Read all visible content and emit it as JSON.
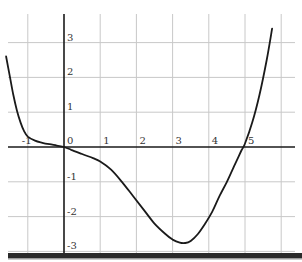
{
  "chart_data": {
    "type": "line",
    "title": "",
    "xlabel": "",
    "ylabel": "",
    "xlim": [
      -1.6,
      6.4
    ],
    "ylim": [
      -3.1,
      3.7
    ],
    "grid": true,
    "x_ticks": [
      -1,
      0,
      1,
      2,
      3,
      4,
      5
    ],
    "x_tick_labels": [
      "-1",
      "0",
      "1",
      "2",
      "3",
      "4",
      "5"
    ],
    "y_ticks": [
      3,
      2,
      1,
      -1,
      -2,
      -3
    ],
    "y_tick_labels": [
      "3",
      "2",
      "1",
      "-1",
      "-2",
      "-3"
    ],
    "series": [
      {
        "name": "f(x)",
        "color": "#1a1a1a",
        "x": [
          -1.6,
          -1.5,
          -1.4,
          -1.3,
          -1.2,
          -1.1,
          -1.0,
          -0.8,
          -0.6,
          -0.4,
          -0.2,
          0.0,
          0.2,
          0.5,
          0.8,
          1.0,
          1.3,
          1.6,
          1.9,
          2.2,
          2.5,
          2.8,
          3.0,
          3.2,
          3.35,
          3.5,
          3.7,
          3.9,
          4.1,
          4.3,
          4.5,
          4.7,
          4.9,
          5.0,
          5.2,
          5.4,
          5.6,
          5.75
        ],
        "y": [
          2.6,
          2.05,
          1.5,
          1.05,
          0.7,
          0.45,
          0.3,
          0.18,
          0.12,
          0.08,
          0.04,
          0.0,
          -0.08,
          -0.2,
          -0.32,
          -0.42,
          -0.65,
          -1.0,
          -1.4,
          -1.8,
          -2.2,
          -2.5,
          -2.66,
          -2.75,
          -2.76,
          -2.7,
          -2.5,
          -2.2,
          -1.85,
          -1.4,
          -1.0,
          -0.55,
          -0.1,
          0.1,
          0.7,
          1.5,
          2.5,
          3.4
        ]
      }
    ]
  }
}
